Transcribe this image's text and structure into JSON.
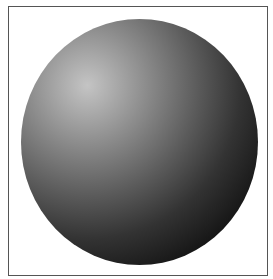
{
  "figure": {
    "frame_color": "#555555",
    "background_color": "#ffffff",
    "highlight_color": "#c4c4c4",
    "shadow_color": "#050505"
  }
}
